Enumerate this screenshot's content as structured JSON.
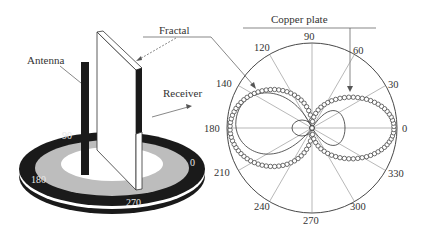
{
  "labels": {
    "fractal": "Fractal",
    "antenna": "Antenna",
    "receiver": "Receiver",
    "copper_plate": "Copper plate"
  },
  "turntable": {
    "angle_labels": [
      "90",
      "0",
      "180",
      "270"
    ]
  },
  "polar_plot": {
    "angle_labels": [
      "0",
      "30",
      "60",
      "90",
      "120",
      "140",
      "180",
      "210",
      "240",
      "270",
      "300",
      "330"
    ]
  },
  "colors": {
    "line": "#555555",
    "disk_dark": "#1a1a1a",
    "disk_gray": "#bdbdbd",
    "plate": "#ffffff"
  }
}
